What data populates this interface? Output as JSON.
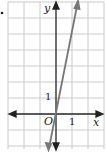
{
  "figure": {
    "bullet": "•",
    "axes": {
      "x_label": "x",
      "y_label": "y",
      "origin_label": "O",
      "x_tick_label": "1",
      "y_tick_label": "1"
    },
    "grid": {
      "x_range": [
        -3,
        3
      ],
      "y_range": [
        -2,
        7
      ],
      "cell_px": 16
    },
    "line": {
      "description": "steep line through origin",
      "approx_slope": 5,
      "color": "#777777"
    },
    "colors": {
      "grid": "#c8c8c8",
      "axis": "#222222",
      "line": "#777777"
    }
  }
}
